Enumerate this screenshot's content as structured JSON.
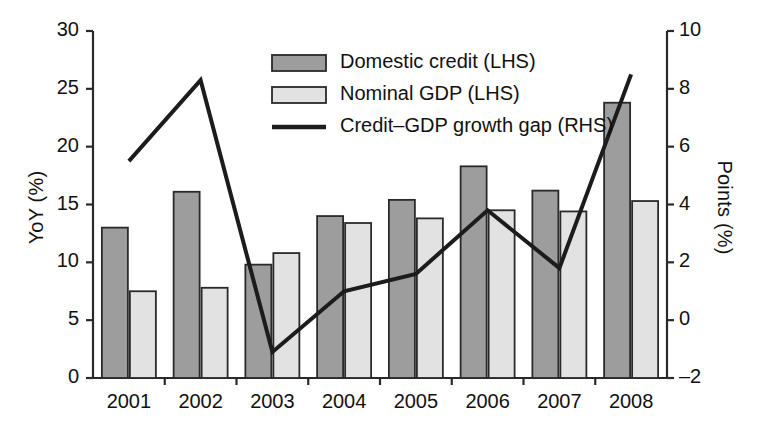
{
  "chart_data": {
    "type": "bar",
    "title": "",
    "subtitle": "",
    "xlabel": "",
    "ylabel": "YoY (%)",
    "ylabel_right": "Points (%)",
    "categories": [
      "2001",
      "2002",
      "2003",
      "2004",
      "2005",
      "2006",
      "2007",
      "2008"
    ],
    "ylim": [
      0,
      30
    ],
    "yticks": [
      0,
      5,
      10,
      15,
      20,
      25,
      30
    ],
    "ytick_labels": [
      "0",
      "5",
      "10",
      "15",
      "20",
      "25",
      "30"
    ],
    "ylim_right": [
      -2,
      10
    ],
    "yticks_right": [
      -2,
      0,
      2,
      4,
      6,
      8,
      10
    ],
    "ytick_labels_right": [
      "–2",
      "0",
      "2",
      "4",
      "6",
      "8",
      "10"
    ],
    "grid": false,
    "legend_position": "top-center",
    "series": [
      {
        "name": "Domestic credit (LHS)",
        "type": "bar",
        "axis": "left",
        "color": "#9d9d9d",
        "edge_color": "#2a2a2a",
        "values": [
          13.0,
          16.1,
          9.8,
          14.0,
          15.4,
          18.3,
          16.2,
          23.8
        ]
      },
      {
        "name": "Nominal GDP (LHS)",
        "type": "bar",
        "axis": "left",
        "color": "#e2e2e2",
        "edge_color": "#2a2a2a",
        "values": [
          7.5,
          7.8,
          10.8,
          13.4,
          13.8,
          14.5,
          14.4,
          15.3
        ]
      },
      {
        "name": "Credit–GDP growth gap (RHS)",
        "type": "line",
        "axis": "right",
        "color": "#1c1c1c",
        "values": [
          5.5,
          8.3,
          -1.1,
          1.0,
          1.6,
          3.8,
          1.8,
          8.5
        ]
      }
    ]
  },
  "legend": {
    "items": [
      {
        "label": "Domestic credit (LHS)",
        "marker": "dark-swatch"
      },
      {
        "label": "Nominal GDP (LHS)",
        "marker": "light-swatch"
      },
      {
        "label": "Credit–GDP growth gap (RHS)",
        "marker": "line-swatch"
      }
    ]
  },
  "colors": {
    "bar_dark": "#9d9d9d",
    "bar_light": "#e2e2e2",
    "line": "#1c1c1c",
    "axis": "#2a2a2a",
    "background": "#ffffff"
  }
}
